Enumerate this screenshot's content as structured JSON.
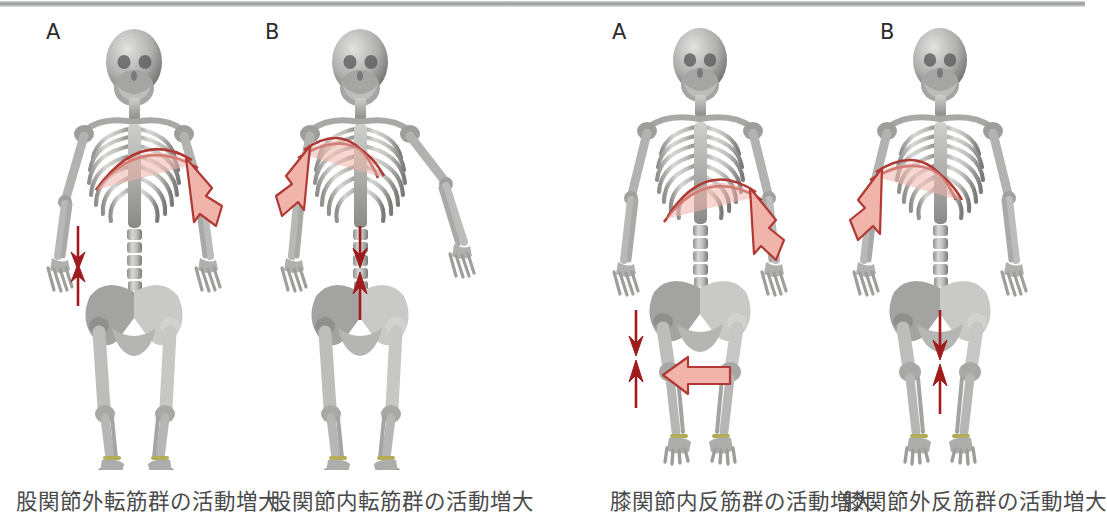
{
  "figure": {
    "background": "#ffffff",
    "top_rule_color": "#9a9b9e",
    "bone_color": "#b9b9b7",
    "bone_shadow": "#6e6e6c",
    "ankle_band_color": "#b5ad55",
    "arrow_outline_color": "#b03a33",
    "arrow_fill_color": "#f0b4ab",
    "thin_arrow_color": "#a01c1c"
  },
  "panels": [
    {
      "letter": "A",
      "caption": "股関節外転筋群の活動増大",
      "arrows": {
        "curve_direction": "right-down",
        "thin_pair_location": "left hip",
        "block_arrow": "none"
      }
    },
    {
      "letter": "B",
      "caption": "股関節内転筋群の活動増大",
      "arrows": {
        "curve_direction": "left-down",
        "thin_pair_location": "center pelvis",
        "block_arrow": "none"
      }
    },
    {
      "letter": "A",
      "caption": "膝関節内反筋群の活動増大",
      "arrows": {
        "curve_direction": "right-down",
        "thin_pair_location": "left of knee",
        "block_arrow": "left-pointing at knee"
      }
    },
    {
      "letter": "B",
      "caption": "膝関節外反筋群の活動増大",
      "arrows": {
        "curve_direction": "left-down",
        "thin_pair_location": "between knees",
        "block_arrow": "none"
      }
    }
  ]
}
